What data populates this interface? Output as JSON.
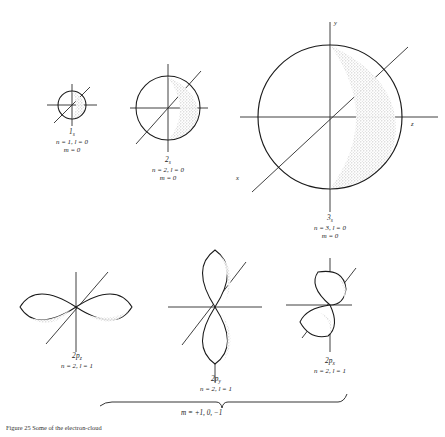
{
  "figure": {
    "background_color": "#ffffff",
    "ink_color": "#1a1a1a",
    "shade_color": "#d8d8d8",
    "caption": "Figure 25 Some of the electron-cloud",
    "s_orbitals": [
      {
        "name": "1s",
        "base": "1",
        "sub": "s",
        "quantum_numbers": "n = 1, l = 0",
        "magnetic": "m = 0",
        "cx": 72,
        "cy": 105,
        "r": 14
      },
      {
        "name": "2s",
        "base": "2",
        "sub": "s",
        "quantum_numbers": "n = 2, l = 0",
        "magnetic": "m = 0",
        "cx": 168,
        "cy": 108,
        "r": 32
      },
      {
        "name": "3s",
        "base": "3",
        "sub": "s",
        "quantum_numbers": "n = 3, l = 0",
        "magnetic": "m = 0",
        "cx": 330,
        "cy": 117,
        "r": 72,
        "axis_labels": {
          "y": "y",
          "z": "z",
          "x": "x"
        }
      }
    ],
    "p_orbitals": [
      {
        "name": "2pz",
        "base": "2p",
        "sub": "z",
        "quantum_numbers": "n = 2, l = 1",
        "orientation": "horizontal",
        "cx": 76,
        "cy": 307
      },
      {
        "name": "2py",
        "base": "2p",
        "sub": "y",
        "quantum_numbers": "n = 2, l = 1",
        "orientation": "vertical",
        "cx": 215,
        "cy": 307
      },
      {
        "name": "2px",
        "base": "2p",
        "sub": "x",
        "quantum_numbers": "n = 2, l = 1",
        "orientation": "depth",
        "cx": 330,
        "cy": 305
      }
    ],
    "brace": {
      "label": "m = +1, 0,  −1",
      "left": 100,
      "right": 345,
      "y": 402
    }
  }
}
